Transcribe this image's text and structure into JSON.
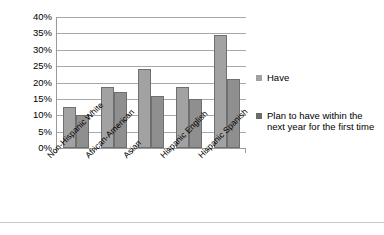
{
  "chart_data": {
    "type": "bar",
    "title": "",
    "subtitle": "",
    "xlabel": "",
    "ylabel": "",
    "ylim": [
      0,
      40
    ],
    "ytick_labels": [
      "40%",
      "35%",
      "30%",
      "25%",
      "20%",
      "15%",
      "10%",
      "5%",
      "0%"
    ],
    "ytick_values": [
      40,
      35,
      30,
      25,
      20,
      15,
      10,
      5,
      0
    ],
    "ytick_suffix": "%",
    "grid": true,
    "legend_position": "right",
    "categories": [
      "Non-Hispanic White",
      "African-American",
      "Asian",
      "Hispanic English",
      "Hispanic Spanish"
    ],
    "series": [
      {
        "name": "Have",
        "color": "#a2a2a2",
        "values": [
          12.5,
          18.5,
          24,
          18.5,
          34.5
        ]
      },
      {
        "name": "Plan to have within the next year for the first time",
        "color": "#8f8f8f",
        "values": [
          10,
          17,
          16,
          15,
          21
        ]
      }
    ]
  },
  "legend": {
    "items": [
      {
        "label": "Have"
      },
      {
        "label": "Plan to have within the next year for the first time"
      }
    ]
  },
  "colors": {
    "series_have": "#a2a2a2",
    "series_plan": "#8f8f8f",
    "legend_swatch_plan": "#6b6b6b",
    "gridline": "#a8a8a8",
    "axis": "#9a9a9a",
    "background": "#ffffff",
    "text": "#000000"
  }
}
